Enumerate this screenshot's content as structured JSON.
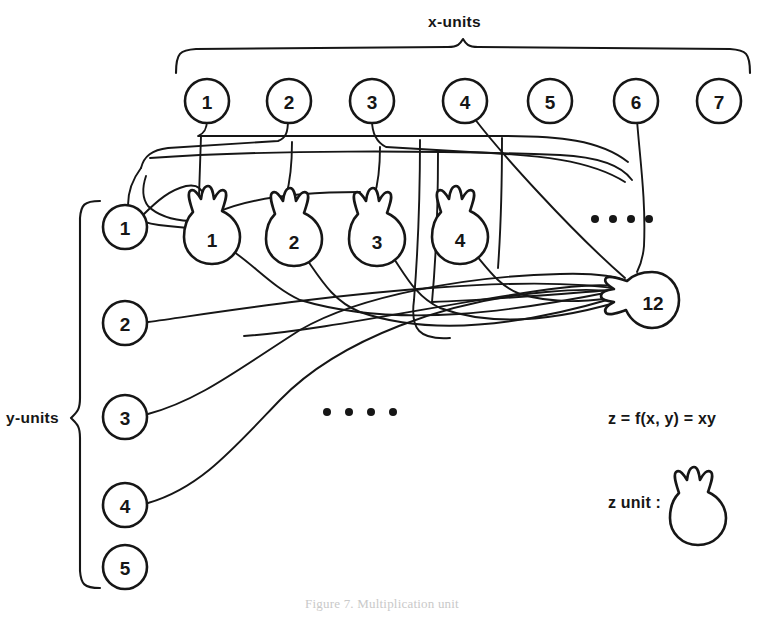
{
  "figure": {
    "x_axis_label": "x-units",
    "y_axis_label": "y-units",
    "formula": "z = f(x, y) = xy",
    "z_unit_label": "z  unit :",
    "caption": "Figure 7.  Multiplication unit",
    "ink_color": "#161616",
    "background_color": "#ffffff"
  },
  "x_units": [
    {
      "label": "1"
    },
    {
      "label": "2"
    },
    {
      "label": "3"
    },
    {
      "label": "4"
    },
    {
      "label": "5"
    },
    {
      "label": "6"
    },
    {
      "label": "7"
    }
  ],
  "y_units": [
    {
      "label": "1"
    },
    {
      "label": "2"
    },
    {
      "label": "3"
    },
    {
      "label": "4"
    },
    {
      "label": "5"
    }
  ],
  "z_units": [
    {
      "label": "1"
    },
    {
      "label": "2"
    },
    {
      "label": "3"
    },
    {
      "label": "4"
    },
    {
      "label": "12"
    }
  ],
  "ellipses": {
    "middle_dots": "••••",
    "upper_right_dots": "••••"
  }
}
